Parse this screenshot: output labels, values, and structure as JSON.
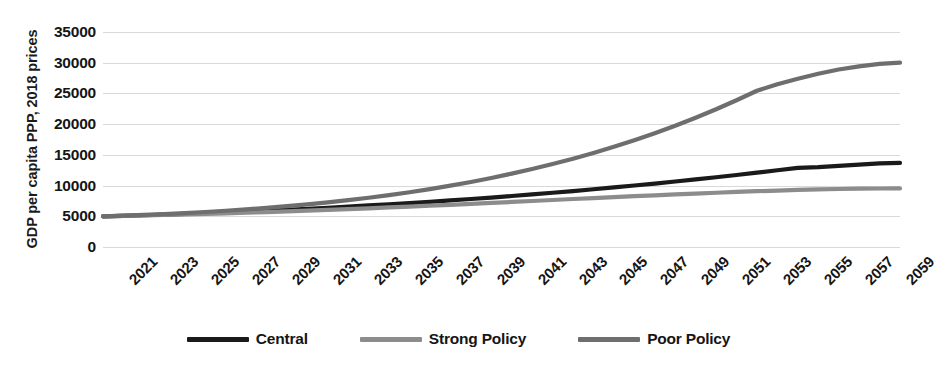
{
  "chart_data": {
    "type": "line",
    "title": "",
    "xlabel": "",
    "ylabel": "GDP per capita PPP, 2018 prices",
    "ylim": [
      0,
      35000
    ],
    "ytick_values": [
      35000,
      30000,
      25000,
      20000,
      15000,
      10000,
      5000,
      0
    ],
    "ytick_labels": [
      "35000",
      "30000",
      "25000",
      "20000",
      "15000",
      "10000",
      "5000",
      "0"
    ],
    "grid": true,
    "legend_position": "bottom",
    "xlim": [
      2021,
      2060
    ],
    "x": [
      2021,
      2022,
      2023,
      2024,
      2025,
      2026,
      2027,
      2028,
      2029,
      2030,
      2031,
      2032,
      2033,
      2034,
      2035,
      2036,
      2037,
      2038,
      2039,
      2040,
      2041,
      2042,
      2043,
      2044,
      2045,
      2046,
      2047,
      2048,
      2049,
      2050,
      2051,
      2052,
      2053,
      2054,
      2055,
      2056,
      2057,
      2058,
      2059,
      2060
    ],
    "xtick_labels": [
      "2021",
      "2023",
      "2025",
      "2027",
      "2029",
      "2031",
      "2033",
      "2035",
      "2037",
      "2039",
      "2041",
      "2043",
      "2045",
      "2047",
      "2049",
      "2051",
      "2053",
      "2055",
      "2057",
      "2059"
    ],
    "series": [
      {
        "name": "Central",
        "color": "#1a1a1a",
        "values": [
          5000,
          5080,
          5170,
          5270,
          5380,
          5500,
          5630,
          5770,
          5910,
          6060,
          6220,
          6390,
          6570,
          6760,
          6950,
          7150,
          7360,
          7580,
          7810,
          8050,
          8300,
          8560,
          8830,
          9110,
          9400,
          9700,
          10010,
          10330,
          10660,
          11000,
          11350,
          11720,
          12100,
          12490,
          12890,
          13000,
          13200,
          13400,
          13600,
          13700
        ]
      },
      {
        "name": "Strong Policy",
        "color": "#8c8c8c",
        "values": [
          5000,
          5060,
          5130,
          5210,
          5290,
          5380,
          5480,
          5580,
          5690,
          5800,
          5920,
          6040,
          6170,
          6300,
          6440,
          6580,
          6720,
          6870,
          7020,
          7170,
          7330,
          7490,
          7650,
          7810,
          7970,
          8120,
          8270,
          8420,
          8560,
          8700,
          8830,
          8960,
          9080,
          9190,
          9290,
          9370,
          9440,
          9490,
          9520,
          9540
        ]
      },
      {
        "name": "Poor Policy",
        "color": "#6e6e6e",
        "values": [
          5000,
          5100,
          5220,
          5360,
          5520,
          5700,
          5900,
          6120,
          6370,
          6640,
          6940,
          7270,
          7630,
          8020,
          8450,
          8920,
          9430,
          9990,
          10590,
          11240,
          11940,
          12700,
          13510,
          14380,
          15310,
          16310,
          17380,
          18520,
          19740,
          21040,
          22420,
          23890,
          25440,
          26500,
          27400,
          28200,
          28900,
          29400,
          29800,
          30000
        ]
      }
    ]
  },
  "legend": {
    "items": [
      {
        "label": "Central"
      },
      {
        "label": "Strong Policy"
      },
      {
        "label": "Poor Policy"
      }
    ]
  }
}
